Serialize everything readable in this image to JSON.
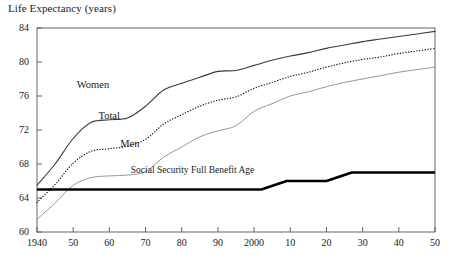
{
  "chart_data": {
    "type": "line",
    "title": "Life Expectancy (years)",
    "xlabel": "",
    "ylabel": "Life Expectancy (years)",
    "xlim": [
      1940,
      2050
    ],
    "ylim": [
      60,
      84
    ],
    "grid": false,
    "legend_position": "inline-annotations",
    "xticks": [
      1940,
      1950,
      1960,
      1970,
      1980,
      1990,
      2000,
      2010,
      2020,
      2030,
      2040,
      2050
    ],
    "xtick_labels": [
      "1940",
      "50",
      "60",
      "70",
      "80",
      "90",
      "2000",
      "10",
      "20",
      "30",
      "40",
      "50"
    ],
    "yticks": [
      60,
      64,
      68,
      72,
      76,
      80,
      84
    ],
    "ytick_labels": [
      "60",
      "64",
      "68",
      "72",
      "76",
      "80",
      "84"
    ],
    "x": [
      1940,
      1945,
      1950,
      1955,
      1960,
      1965,
      1970,
      1975,
      1980,
      1985,
      1990,
      1995,
      2000,
      2005,
      2010,
      2015,
      2020,
      2025,
      2030,
      2035,
      2040,
      2045,
      2050
    ],
    "series": [
      {
        "name": "Women",
        "label": "Women",
        "style": "solid",
        "color": "#3a3a3a",
        "width": 1.1,
        "label_x": 1951,
        "label_y": 77.0,
        "values": [
          65.5,
          68.0,
          71.0,
          72.9,
          73.2,
          73.4,
          74.8,
          76.7,
          77.5,
          78.2,
          78.9,
          79.0,
          79.6,
          80.2,
          80.7,
          81.1,
          81.6,
          82.0,
          82.4,
          82.7,
          83.0,
          83.3,
          83.6
        ]
      },
      {
        "name": "Total",
        "label": "Total",
        "style": "dotted",
        "color": "#1a1a1a",
        "width": 1.3,
        "label_x": 1957,
        "label_y": 73.3,
        "values": [
          63.5,
          65.6,
          68.1,
          69.5,
          69.8,
          70.1,
          70.9,
          72.7,
          73.8,
          74.8,
          75.5,
          75.9,
          76.9,
          77.6,
          78.3,
          78.8,
          79.4,
          79.9,
          80.3,
          80.6,
          81.0,
          81.3,
          81.6
        ]
      },
      {
        "name": "Men",
        "label": "Men",
        "style": "solid",
        "color": "#8a8a8a",
        "width": 0.9,
        "label_x": 1963,
        "label_y": 70.0,
        "values": [
          61.5,
          63.4,
          65.5,
          66.4,
          66.6,
          66.7,
          67.1,
          68.8,
          70.0,
          71.2,
          71.9,
          72.5,
          74.2,
          75.1,
          76.0,
          76.5,
          77.1,
          77.6,
          78.0,
          78.4,
          78.8,
          79.1,
          79.4
        ]
      }
    ],
    "annotation_line": {
      "name": "Social Security Full Benefit Age",
      "label": "Social Security Full Benefit Age",
      "style": "solid",
      "color": "#000000",
      "width": 2.6,
      "label_x": 1983,
      "label_y": 67.0,
      "points": [
        {
          "x": 1940,
          "y": 65
        },
        {
          "x": 2002,
          "y": 65
        },
        {
          "x": 2009,
          "y": 66
        },
        {
          "x": 2020,
          "y": 66
        },
        {
          "x": 2027,
          "y": 67
        },
        {
          "x": 2050,
          "y": 67
        }
      ]
    }
  }
}
